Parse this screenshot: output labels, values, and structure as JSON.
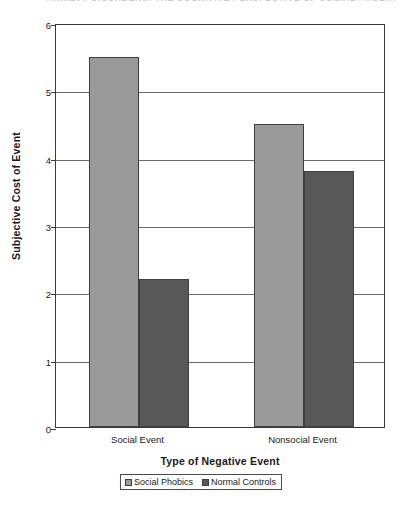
{
  "running_header": "ANXIETY DISORDERS: THE COGNITIVE PERSPECTIVE OF SOCIAL PHOBIA",
  "chart_data": {
    "type": "bar",
    "title": "",
    "subtitle": "",
    "xlabel": "Type of Negative Event",
    "ylabel": "Subjective Cost of Event",
    "categories": [
      "Social Event",
      "Nonsocial Event"
    ],
    "series": [
      {
        "name": "Social Phobics",
        "values": [
          5.5,
          4.5
        ],
        "color": "#9a9a9a"
      },
      {
        "name": "Normal Controls",
        "values": [
          2.2,
          3.8
        ],
        "color": "#585858"
      }
    ],
    "ylim": [
      0,
      6
    ],
    "yticks": [
      0,
      1,
      2,
      3,
      4,
      5,
      6
    ],
    "ytick_labels": [
      "0",
      "1",
      "2",
      "3",
      "4",
      "5",
      "6"
    ],
    "grid": "horizontal",
    "legend_position": "bottom",
    "axis_color": "#3a3a3a",
    "gridline_color": "#6b6b6b"
  },
  "y_ticks": [
    {
      "label": "6",
      "value": 6
    },
    {
      "label": "5",
      "value": 5
    },
    {
      "label": "4",
      "value": 4
    },
    {
      "label": "3",
      "value": 3
    },
    {
      "label": "2",
      "value": 2
    },
    {
      "label": "1",
      "value": 1
    },
    {
      "label": "0",
      "value": 0
    }
  ],
  "x_ticks": [
    {
      "label": "Social Event"
    },
    {
      "label": "Nonsocial Event"
    }
  ],
  "bars": [
    {
      "label": "Social Phobics - Social Event",
      "value": "5.5"
    },
    {
      "label": "Normal Controls - Social Event",
      "value": "2.2"
    },
    {
      "label": "Social Phobics - Nonsocial Event",
      "value": "4.5"
    },
    {
      "label": "Normal Controls - Nonsocial Event",
      "value": "3.8"
    }
  ],
  "legend": {
    "entries": [
      {
        "label": "Social Phobics",
        "color": "#9a9a9a"
      },
      {
        "label": "Normal Controls",
        "color": "#585858"
      }
    ]
  }
}
